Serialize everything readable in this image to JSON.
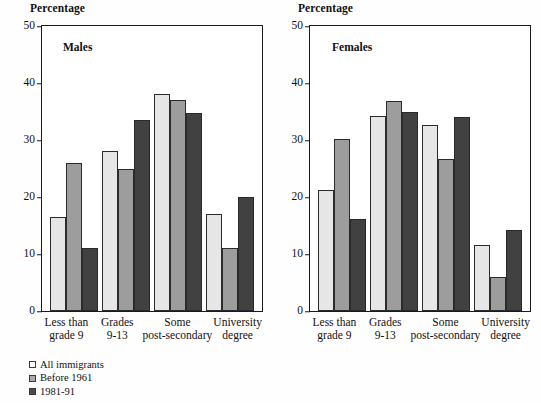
{
  "chart_data": {
    "type": "bar",
    "title": "",
    "ylabel": "Percentage",
    "xlabel": "",
    "ylim": [
      0,
      50
    ],
    "yticks": [
      0,
      10,
      20,
      30,
      40,
      50
    ],
    "grid": false,
    "legend_position": "bottom-left",
    "categories": [
      "Less than grade 9",
      "Grades 9-13",
      "Some post-secondary",
      "University degree"
    ],
    "category_lines": [
      [
        "Less than",
        "grade 9"
      ],
      [
        "Grades",
        "9-13"
      ],
      [
        "Some",
        "post-secondary"
      ],
      [
        "University",
        "degree"
      ]
    ],
    "series_names": [
      "All immigrants",
      "Before 1961",
      "1981-91"
    ],
    "series_colors": [
      "#e6e6e6",
      "#9d9d9d",
      "#414141"
    ],
    "panels": [
      {
        "label": "Males",
        "axis_title": "Percentage",
        "series": [
          {
            "name": "All immigrants",
            "values": [
              16.5,
              28.0,
              38.0,
              17.0
            ]
          },
          {
            "name": "Before 1961",
            "values": [
              26.0,
              25.0,
              37.0,
              11.0
            ]
          },
          {
            "name": "1981-91",
            "values": [
              11.0,
              33.5,
              34.7,
              20.0
            ]
          }
        ]
      },
      {
        "label": "Females",
        "axis_title": "Percentage",
        "series": [
          {
            "name": "All immigrants",
            "values": [
              21.3,
              34.2,
              32.7,
              11.5
            ]
          },
          {
            "name": "Before 1961",
            "values": [
              30.2,
              36.8,
              26.6,
              6.0
            ]
          },
          {
            "name": "1981-91",
            "values": [
              16.2,
              34.9,
              34.1,
              14.2
            ]
          }
        ]
      }
    ]
  },
  "legend": {
    "items": [
      {
        "label": "All immigrants"
      },
      {
        "label": "Before 1961"
      },
      {
        "label": "1981-91"
      }
    ]
  }
}
